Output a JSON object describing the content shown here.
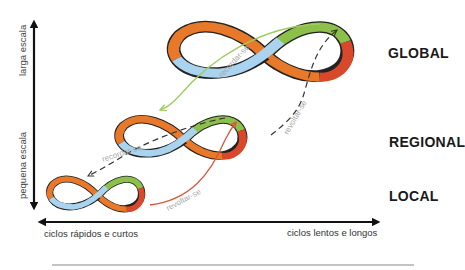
{
  "axes": {
    "y_top_label": "larga escala",
    "y_bottom_label": "pequena escala",
    "x_left_label": "ciclos rápidos e curtos",
    "x_right_label": "ciclos lentos e longos"
  },
  "scales": {
    "global": "GLOBAL",
    "regional": "REGIONAL",
    "local": "LOCAL"
  },
  "arrows": {
    "remember_global_to_regional": "recordar-se",
    "remember_regional_to_local": "recordar-se",
    "revolt_local_to_regional": "revoltar-se",
    "revolt_regional_to_global": "revoltar-se"
  },
  "colors": {
    "orange": "#e8792a",
    "green": "#8cc04a",
    "red": "#d9482b",
    "blue": "#a9d3ee",
    "outline": "#222222",
    "remember_arrow": "#9ccc5a",
    "revolt_arrow": "#d9573a",
    "dashed": "#333333",
    "arrow_text": "#a8a8a8"
  }
}
